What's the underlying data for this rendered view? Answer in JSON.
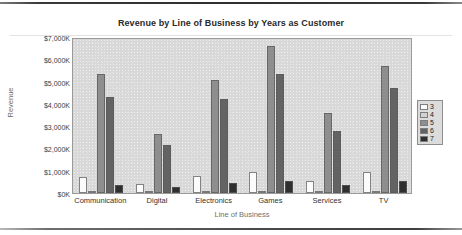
{
  "chart_data": {
    "type": "bar",
    "title": "Revenue by Line of Business by Years as Customer",
    "xlabel": "Line of Business",
    "ylabel": "Revenue",
    "categories": [
      "Communication",
      "Digital",
      "Electronics",
      "Games",
      "Services",
      "TV"
    ],
    "series": [
      {
        "name": "3",
        "color": "#fbfbfb",
        "values": [
          700,
          400,
          750,
          950,
          550,
          950
        ]
      },
      {
        "name": "4",
        "color": "#d2d2d2",
        "values": [
          60,
          40,
          60,
          70,
          50,
          70
        ]
      },
      {
        "name": "5",
        "color": "#8e8e8e",
        "values": [
          5350,
          2650,
          5050,
          6600,
          3600,
          5700
        ]
      },
      {
        "name": "6",
        "color": "#636363",
        "values": [
          4300,
          2150,
          4200,
          5350,
          2800,
          4700
        ]
      },
      {
        "name": "7",
        "color": "#2f2f2f",
        "values": [
          350,
          250,
          450,
          550,
          350,
          550
        ]
      }
    ],
    "ylim": [
      0,
      7000
    ],
    "ytick_labels": [
      "$7,000K",
      "$6,000K",
      "$5,000K",
      "$4,000K",
      "$3,000K",
      "$2,000K",
      "$1,000K",
      "$0K"
    ],
    "ytick_values": [
      7000,
      6000,
      5000,
      4000,
      3000,
      2000,
      1000,
      0
    ],
    "grid": false,
    "legend_position": "right",
    "legend_title": "",
    "plot_background": "#d8d8d8"
  }
}
